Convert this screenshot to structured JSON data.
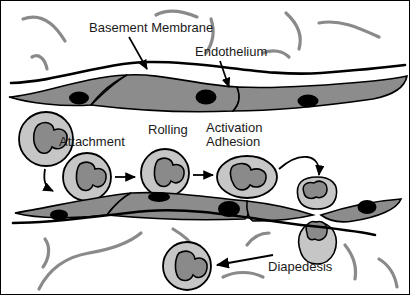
{
  "figure": {
    "width": 410,
    "height": 295
  },
  "labels": {
    "basement_membrane": "Basement Membrane",
    "endothelium": "Endothelium",
    "attachment": "Attachment",
    "rolling": "Rolling",
    "activation": "Activation",
    "adhesion": "Adhesion",
    "diapedesis": "Diapedesis"
  },
  "colors": {
    "outline": "#000000",
    "endothelium_fill": "#8c8c8c",
    "endothelium_nucleus": "#000000",
    "leukocyte_cytoplasm": "#c6c6c6",
    "leukocyte_nucleus": "#8a8a8a",
    "matrix_fiber": "#8a8a8a",
    "background": "#ffffff",
    "arrow": "#000000"
  },
  "structures": [
    {
      "name": "basement-membrane-line",
      "kind": "line",
      "note": "black wavy line above endothelium"
    },
    {
      "name": "endothelium-upper-layer",
      "kind": "cell-layer",
      "nuclei": 3
    },
    {
      "name": "endothelium-lower-layer",
      "kind": "cell-layer",
      "nuclei": 4
    },
    {
      "name": "matrix-fibers-top",
      "kind": "fibers",
      "count": 6
    },
    {
      "name": "matrix-fibers-bottom",
      "kind": "fibers",
      "count": 6
    }
  ],
  "leukocytes": [
    {
      "name": "leukocyte-free",
      "stage": "free-flowing",
      "shape": "round"
    },
    {
      "name": "leukocyte-attachment",
      "stage": "attachment",
      "shape": "round"
    },
    {
      "name": "leukocyte-rolling",
      "stage": "rolling",
      "shape": "round"
    },
    {
      "name": "leukocyte-adhesion",
      "stage": "activation-adhesion",
      "shape": "flattened-oval"
    },
    {
      "name": "leukocyte-diapedesis",
      "stage": "diapedesis",
      "shape": "hourglass"
    },
    {
      "name": "leukocyte-migrated",
      "stage": "migrated",
      "shape": "round"
    }
  ],
  "arrows": [
    {
      "name": "arrow-basement-membrane",
      "from": "label",
      "to": "basement-membrane-line"
    },
    {
      "name": "arrow-endothelium",
      "from": "label",
      "to": "endothelium-upper-layer"
    },
    {
      "name": "arrow-free-to-attachment",
      "style": "curved"
    },
    {
      "name": "arrow-attachment-to-rolling",
      "style": "straight"
    },
    {
      "name": "arrow-rolling-to-adhesion",
      "style": "straight"
    },
    {
      "name": "arrow-adhesion-to-diapedesis",
      "style": "curved"
    },
    {
      "name": "arrow-diapedesis-to-migrated",
      "style": "straight"
    }
  ]
}
